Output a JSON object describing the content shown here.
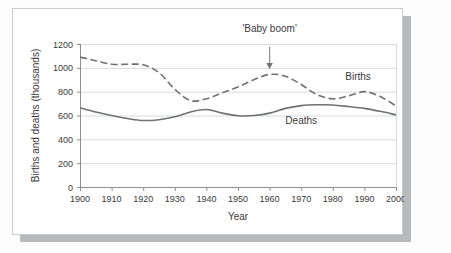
{
  "card": {
    "background": "#ffffff",
    "border_color": "#c9cbcc",
    "shadow_color": "#b7b9ba"
  },
  "chart_data": {
    "type": "line",
    "title": "'Baby boom'",
    "xlabel": "Year",
    "ylabel": "Births and deaths (thousands)",
    "xlim": [
      1900,
      2000
    ],
    "ylim": [
      0,
      1200
    ],
    "xticks": [
      "1900",
      "1910",
      "1920",
      "1930",
      "1940",
      "1950",
      "1960",
      "1970",
      "1980",
      "1990",
      "2000"
    ],
    "yticks": [
      "0",
      "200",
      "400",
      "600",
      "800",
      "1000",
      "1200"
    ],
    "grid": "horizontal",
    "legend": "inline-labels",
    "line_color": "#6e7072",
    "grid_color": "#d8dadb",
    "axis_color": "#8c8e90",
    "annotations": [
      {
        "name": "baby-boom",
        "text": "'Baby boom'",
        "arrow_from_year": 1960,
        "arrow_from_value": 1200,
        "arrow_to_value": 990
      }
    ],
    "series": [
      {
        "name": "Births",
        "label": "Births",
        "style": "dashed",
        "label_year": 1988,
        "label_value": 900,
        "x": [
          1900,
          1905,
          1910,
          1915,
          1920,
          1925,
          1930,
          1935,
          1940,
          1945,
          1950,
          1955,
          1960,
          1965,
          1970,
          1975,
          1980,
          1985,
          1990,
          1995,
          2000
        ],
        "values": [
          1090,
          1060,
          1030,
          1030,
          1025,
          960,
          820,
          725,
          740,
          790,
          840,
          900,
          945,
          930,
          860,
          775,
          740,
          765,
          800,
          760,
          680
        ]
      },
      {
        "name": "Deaths",
        "label": "Deaths",
        "style": "solid",
        "label_year": 1970,
        "label_value": 530,
        "x": [
          1900,
          1905,
          1910,
          1915,
          1920,
          1925,
          1930,
          1935,
          1940,
          1945,
          1950,
          1955,
          1960,
          1965,
          1970,
          1975,
          1980,
          1985,
          1990,
          1995,
          2000
        ],
        "values": [
          665,
          630,
          600,
          575,
          558,
          565,
          590,
          630,
          650,
          620,
          598,
          600,
          620,
          660,
          683,
          690,
          688,
          675,
          660,
          635,
          605
        ]
      }
    ]
  }
}
